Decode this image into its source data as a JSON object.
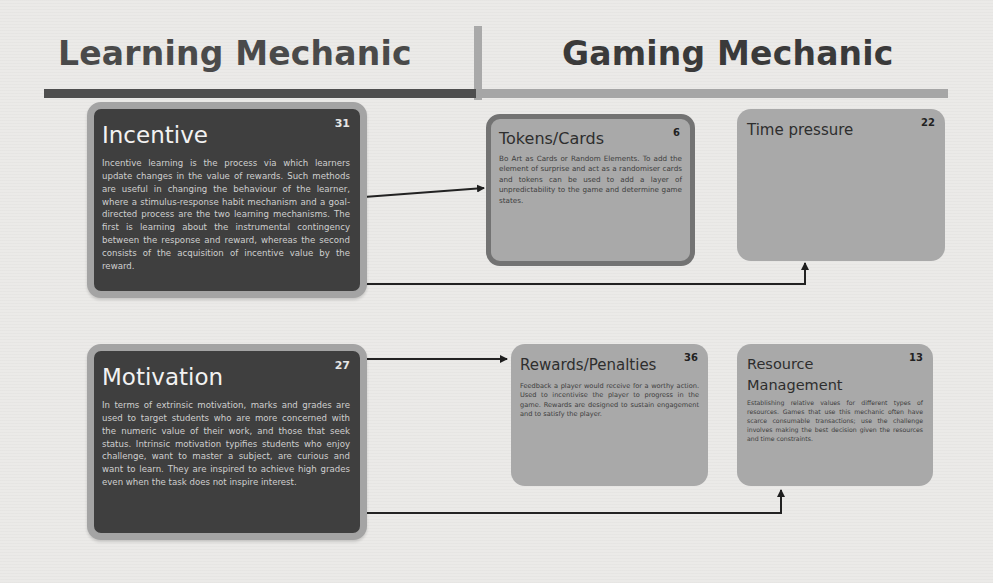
{
  "header": {
    "left_title": "Learning Mechanic",
    "right_title": "Gaming Mechanic"
  },
  "learning_mechanics": [
    {
      "id": "incentive",
      "number": "31",
      "title": "Incentive",
      "body": "Incentive learning is the process via which learners update changes in the value of rewards. Such methods are useful in changing the behaviour of the learner, where a stimulus-response habit mechanism and a goal- directed process are the two learning mechanisms. The first is learning about the instrumental contingency between the response and reward, whereas the second consists of the acquisition of incentive value by the reward."
    },
    {
      "id": "motivation",
      "number": "27",
      "title": "Motivation",
      "body": "In terms of extrinsic motivation, marks and grades are used to target students who are more concerned with the numeric value of their work, and those that seek status. Intrinsic motivation typifies students who enjoy challenge, want to master a subject, are curious and want to learn. They are inspired to achieve high grades even when the task does not inspire interest."
    }
  ],
  "gaming_mechanics": [
    {
      "id": "tokens-cards",
      "number": "6",
      "title": "Tokens/Cards",
      "body": "Bo Art as Cards or Random Elements. To add the element of surprise and act as a randomiser cards and tokens can be used to add a layer of unpredictability to the game and determine game states."
    },
    {
      "id": "time-pressure",
      "number": "22",
      "title": "Time pressure",
      "body": ""
    },
    {
      "id": "rewards-penalties",
      "number": "36",
      "title": "Rewards/Penalties",
      "body": "Feedback a player would receive for a worthy action. Used to incentivise the player to progress in the game. Rewards are designed to sustain engagement and to satisfy the player."
    },
    {
      "id": "resource-management",
      "number": "13",
      "title": "Resource Management",
      "body": "Establishing relative values for different types of resources. Games that use this mechanic often have scarce consumable transactions; use the challenge involves making the best decision given the resources and time constraints."
    }
  ],
  "connections": [
    {
      "from": "incentive",
      "to": "tokens-cards"
    },
    {
      "from": "incentive",
      "to": "time-pressure"
    },
    {
      "from": "motivation",
      "to": "rewards-penalties"
    },
    {
      "from": "motivation",
      "to": "resource-management"
    }
  ],
  "colors": {
    "dark_card": "#3f3f3f",
    "dark_card_border": "#a4a4a4",
    "light_card": "#a9a9a9",
    "header_bar_left": "#4e4e4e",
    "header_bar_right": "#a6a6a6"
  }
}
